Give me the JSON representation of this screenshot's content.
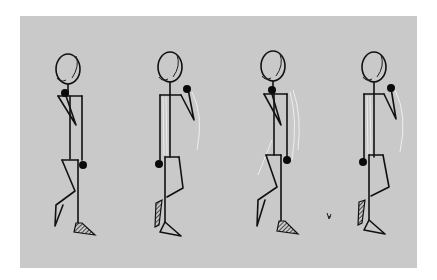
{
  "image": {
    "description": "Four sequential frames of a walking stick figure drawn in black ink on a light gray panel",
    "background_color": "#c9c9c9",
    "border_color": "#ffffff",
    "ink_color": "#111111"
  },
  "frames": [
    {
      "index": 1,
      "label": "Frame 1 - contact pose, hand at chest"
    },
    {
      "index": 2,
      "label": "Frame 2 - passing pose, arm raised"
    },
    {
      "index": 3,
      "label": "Frame 3 - contact pose, hand at chest"
    },
    {
      "index": 4,
      "label": "Frame 4 - passing pose, arm raised"
    }
  ]
}
